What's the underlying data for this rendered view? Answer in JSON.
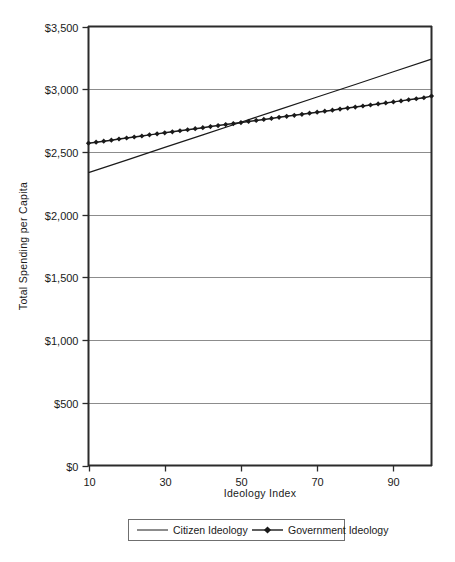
{
  "chart_data": {
    "type": "line",
    "title": "",
    "xlabel": "Ideology Index",
    "ylabel": "Total Spending  per  Capita",
    "xlim": [
      10,
      100
    ],
    "ylim": [
      0,
      3500
    ],
    "xticks": [
      10,
      30,
      50,
      70,
      90
    ],
    "xtick_labels": [
      "10",
      "30",
      "50",
      "70",
      "90"
    ],
    "yticks": [
      0,
      500,
      1000,
      1500,
      2000,
      2500,
      3000,
      3500
    ],
    "ytick_labels": [
      "$0",
      "$500",
      "$1,000",
      "$1,500",
      "$2,000",
      "$2,500",
      "$3,000",
      "$3,500"
    ],
    "grid": true,
    "grid_axis": "y",
    "legend_position": "below-axes",
    "series": [
      {
        "name": "Citizen Ideology",
        "marker": "none",
        "color": "#1a1a1a",
        "x": [
          10,
          20,
          30,
          40,
          50,
          60,
          70,
          80,
          90,
          100
        ],
        "values": [
          2335,
          2435,
          2536,
          2636,
          2737,
          2837,
          2938,
          3038,
          3139,
          3240
        ]
      },
      {
        "name": "Government Ideology",
        "marker": "diamond",
        "color": "#1a1a1a",
        "x": [
          10,
          12,
          14,
          16,
          18,
          20,
          22,
          24,
          26,
          28,
          30,
          32,
          34,
          36,
          38,
          40,
          42,
          44,
          46,
          48,
          50,
          52,
          54,
          56,
          58,
          60,
          62,
          64,
          66,
          68,
          70,
          72,
          74,
          76,
          78,
          80,
          82,
          84,
          86,
          88,
          90,
          92,
          94,
          96,
          98,
          100
        ],
        "values": [
          2570,
          2578,
          2586,
          2594,
          2603,
          2611,
          2619,
          2627,
          2636,
          2644,
          2652,
          2660,
          2669,
          2677,
          2685,
          2693,
          2702,
          2710,
          2718,
          2726,
          2734,
          2743,
          2751,
          2759,
          2767,
          2776,
          2784,
          2792,
          2800,
          2809,
          2817,
          2825,
          2833,
          2842,
          2850,
          2858,
          2866,
          2874,
          2883,
          2891,
          2899,
          2907,
          2916,
          2924,
          2932,
          2945
        ]
      }
    ],
    "legend": [
      {
        "label": "Citizen Ideology",
        "marker": "none"
      },
      {
        "label": "Government Ideology",
        "marker": "diamond"
      }
    ],
    "colors": {
      "axis": "#2b2b2b",
      "grid": "#8c8c8c",
      "series": "#1a1a1a",
      "text": "#1a1a1a",
      "background": "#ffffff"
    }
  }
}
